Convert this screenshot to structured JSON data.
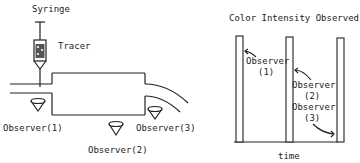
{
  "left_diagram": {
    "syringe_label": "Syringe",
    "tracer_label": "Tracer",
    "observers": [
      {
        "label": "Observer(1)"
      },
      {
        "label": "Observer(2)"
      },
      {
        "label": "Observer(3)"
      }
    ]
  },
  "right_diagram": {
    "title": "Color Intensity Observed",
    "xlabel": "time",
    "annotations": [
      {
        "line1": "Observer",
        "line2": "(1)"
      },
      {
        "line1": "Observer",
        "line2": "(2)"
      },
      {
        "line1": "Observer",
        "line2": "(3)"
      }
    ]
  },
  "colors": {
    "ink": "#222222",
    "background": "#ffffff"
  }
}
